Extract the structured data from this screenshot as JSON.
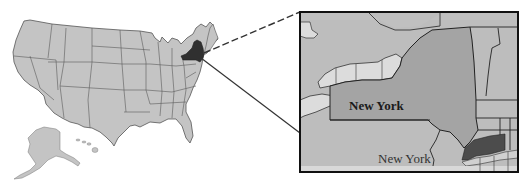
{
  "figure": {
    "us_map": {
      "highlighted_state": "New York",
      "fill": "#c4c4c4",
      "border": "#4a4a4a",
      "highlight_fill": "#303030"
    },
    "inset": {
      "state_label": "New York",
      "city_label": "New York",
      "state_fill": "#a4a4a4",
      "neighbor_fill": "#bdbdbd",
      "lake_fill": "#dcdcdc",
      "city_highlight_fill": "#4c4c4c",
      "frame_color": "#111111"
    },
    "connectors": {
      "dashed": "state-to-inset-top",
      "solid": "city-to-inset-bottom"
    }
  }
}
